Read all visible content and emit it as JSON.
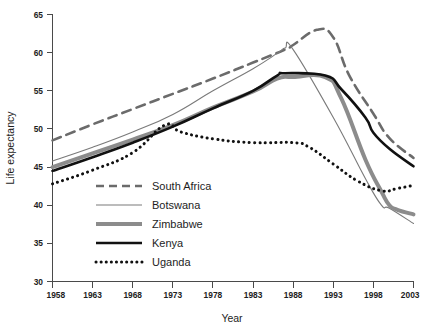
{
  "figure": {
    "background_color": "#ffffff",
    "width": 425,
    "height": 332
  },
  "axes": {
    "x_title": "Year",
    "y_title": "Life expectancy",
    "x_ticks": [
      "1958",
      "1963",
      "1968",
      "1973",
      "1978",
      "1983",
      "1988",
      "1993",
      "1998",
      "2003"
    ],
    "y_ticks": [
      "30",
      "35",
      "40",
      "45",
      "50",
      "55",
      "60",
      "65"
    ],
    "axis_color": "#4a4a4a"
  },
  "legend": {
    "position": "inside-lower-left",
    "entries": [
      {
        "label": "South Africa",
        "style": "dashed",
        "color": "#6b6b6b",
        "width": 2.6
      },
      {
        "label": "Botswana",
        "style": "solid-thin",
        "color": "#7a7a7a",
        "width": 1.1
      },
      {
        "label": "Zimbabwe",
        "style": "solid-thick",
        "color": "#8c8c8c",
        "width": 4.0
      },
      {
        "label": "Kenya",
        "style": "solid-thick",
        "color": "#111111",
        "width": 2.6
      },
      {
        "label": "Uganda",
        "style": "dotted",
        "color": "#111111",
        "width": 3.0
      }
    ]
  },
  "chart_data": {
    "type": "line",
    "title": "",
    "subtitle": "",
    "xlabel": "Year",
    "ylabel": "Life expectancy",
    "xlim": [
      1958,
      2003
    ],
    "ylim": [
      30,
      65
    ],
    "xticks": [
      1958,
      1963,
      1968,
      1973,
      1978,
      1983,
      1988,
      1993,
      1998,
      2003
    ],
    "yticks": [
      30,
      35,
      40,
      45,
      50,
      55,
      60,
      65
    ],
    "grid": false,
    "legend_position": "inside lower-left",
    "x": [
      1958,
      1963,
      1968,
      1973,
      1978,
      1983,
      1988,
      1993,
      1998,
      2003
    ],
    "series": [
      {
        "name": "South Africa",
        "color": "#6b6b6b",
        "linestyle": "dashed",
        "linewidth": 2.6,
        "values": [
          48.5,
          50.6,
          52.6,
          54.6,
          56.6,
          58.7,
          60.8,
          62.6,
          52.0,
          46.2
        ],
        "notes": "peak 63.0 at 1991; steep decline after 1991"
      },
      {
        "name": "Botswana",
        "color": "#7a7a7a",
        "linestyle": "solid",
        "linewidth": 1.1,
        "values": [
          45.8,
          47.6,
          49.6,
          51.9,
          55.0,
          57.9,
          60.5,
          51.5,
          41.0,
          37.6
        ],
        "notes": "peak 60.6 at 1987; sharp collapse 1988-1999"
      },
      {
        "name": "Zimbabwe",
        "color": "#8c8c8c",
        "linestyle": "solid",
        "linewidth": 4.0,
        "values": [
          45.0,
          46.8,
          48.6,
          50.5,
          52.8,
          54.9,
          56.6,
          56.8,
          41.8,
          38.8
        ],
        "notes": "peak 56.8 at 1987-1992; collapse 1993-1999 then flat"
      },
      {
        "name": "Kenya",
        "color": "#111111",
        "linestyle": "solid",
        "linewidth": 2.6,
        "values": [
          44.5,
          46.3,
          48.2,
          50.3,
          52.7,
          55.0,
          57.2,
          57.0,
          49.5,
          45.1
        ],
        "notes": "peak 57.3 at 1987; gradual decline after 1993"
      },
      {
        "name": "Uganda",
        "color": "#111111",
        "linestyle": "dotted",
        "linewidth": 3.0,
        "values": [
          42.8,
          44.6,
          46.9,
          50.4,
          48.7,
          48.2,
          48.2,
          45.4,
          42.0,
          42.6
        ],
        "notes": "peak 50.5 at 1972; slow decline, trough 41.9 at 1999, slight rise to 2003"
      }
    ]
  }
}
